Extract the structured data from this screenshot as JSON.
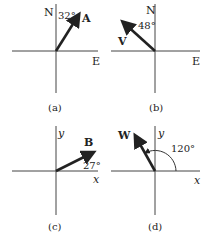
{
  "figure": {
    "panels": [
      {
        "id": "a",
        "caption": "(a)",
        "axis_v": "N",
        "axis_h": "E",
        "vector": "A",
        "angle": "32°",
        "angle_ref": "from N toward E"
      },
      {
        "id": "b",
        "caption": "(b)",
        "axis_v": "N",
        "axis_h": "E",
        "vector": "V",
        "angle": "48°",
        "angle_ref": "from N toward W"
      },
      {
        "id": "c",
        "caption": "(c)",
        "axis_v": "y",
        "axis_h": "x",
        "vector": "B",
        "angle": "27°",
        "angle_ref": "from +x"
      },
      {
        "id": "d",
        "caption": "(d)",
        "axis_v": "y",
        "axis_h": "x",
        "vector": "W",
        "angle": "120°",
        "angle_ref": "from +x counterclockwise"
      }
    ]
  },
  "colors": {
    "ink": "#222222",
    "background": "#ffffff"
  }
}
